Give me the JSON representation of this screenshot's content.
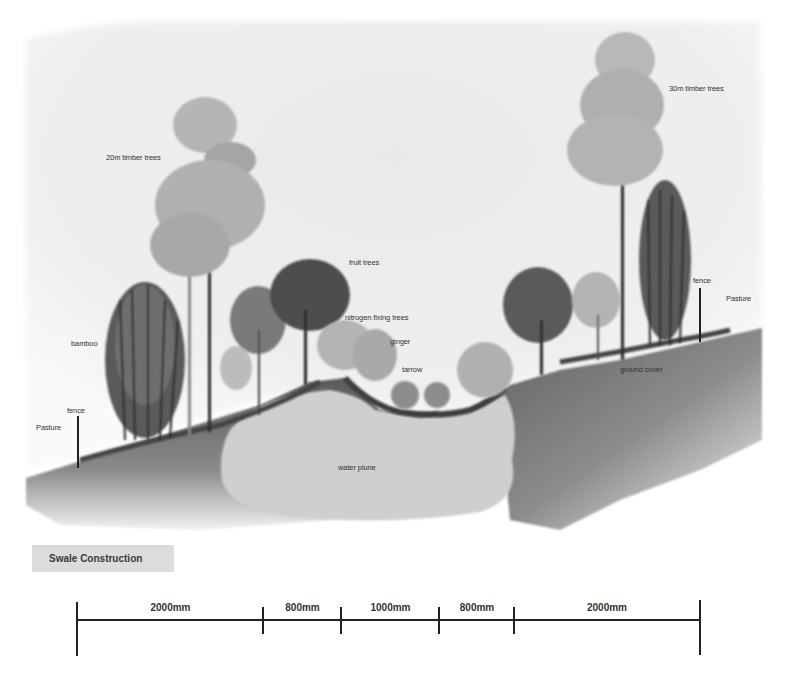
{
  "title": "Swale Construction",
  "labels": {
    "timber_20m": "20m timber trees",
    "timber_30m": "30m timber trees",
    "fruit_trees": "fruit trees",
    "nitrogen_fixing": "nitrogen fixing trees",
    "ginger": "ginger",
    "tarrow": "tarrow",
    "bamboo": "bamboo",
    "fence_left": "fence",
    "fence_right": "fence",
    "pasture_left": "Pasture",
    "pasture_right": "Pasture",
    "ground_cover": "ground cover",
    "water_plume": "water plune"
  },
  "scale_bar": {
    "segments": [
      {
        "label": "2000mm",
        "value_mm": 2000
      },
      {
        "label": "800mm",
        "value_mm": 800
      },
      {
        "label": "1000mm",
        "value_mm": 1000
      },
      {
        "label": "800mm",
        "value_mm": 800
      },
      {
        "label": "2000mm",
        "value_mm": 2000
      }
    ],
    "total_mm": 6600
  },
  "colors": {
    "sky": "#eeeeee",
    "ground_dark": "#6e6e6e",
    "water_plume": "#cfcfcf",
    "foliage_light": "#a9a9a9",
    "foliage_dark": "#4a4a4a",
    "title_bg": "#dcdcdc"
  }
}
